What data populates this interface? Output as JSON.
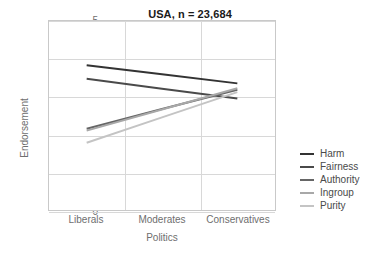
{
  "chart_data": {
    "type": "line",
    "title": "USA, n = 23,684",
    "xlabel": "Politics",
    "ylabel": "Endorsement",
    "categories": [
      "Liberals",
      "Moderates",
      "Conservatives"
    ],
    "ylim": [
      0,
      5
    ],
    "yticks": [
      0,
      1,
      2,
      3,
      4,
      5
    ],
    "grid": true,
    "legend_position": "right",
    "series": [
      {
        "name": "Harm",
        "values": [
          3.83,
          3.59,
          3.35
        ],
        "color": "#333333"
      },
      {
        "name": "Fairness",
        "values": [
          3.47,
          3.21,
          2.95
        ],
        "color": "#4a4a4a"
      },
      {
        "name": "Authority",
        "values": [
          2.15,
          2.67,
          3.18
        ],
        "color": "#666666"
      },
      {
        "name": "Ingroup",
        "values": [
          2.1,
          2.66,
          3.22
        ],
        "color": "#a8a8a8"
      },
      {
        "name": "Purity",
        "values": [
          1.78,
          2.45,
          3.12
        ],
        "color": "#c4c4c4"
      }
    ]
  },
  "legend": {
    "items": [
      {
        "label": "Harm"
      },
      {
        "label": "Fairness"
      },
      {
        "label": "Authority"
      },
      {
        "label": "Ingroup"
      },
      {
        "label": "Purity"
      }
    ]
  },
  "axis": {
    "y_tick_labels": [
      "5",
      "4",
      "3",
      "2",
      "1",
      "0"
    ],
    "x_tick_labels": [
      "Liberals",
      "Moderates",
      "Conservatives"
    ]
  }
}
